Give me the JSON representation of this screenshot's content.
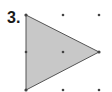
{
  "problem": {
    "number_label": "3."
  },
  "figure": {
    "shape": "triangle",
    "fill_color": "#c8c8c8",
    "stroke_color": "#555555",
    "dot_color": "#444444",
    "grid": {
      "columns": [
        26,
        63,
        99
      ],
      "rows": [
        15,
        52,
        90
      ]
    },
    "vertices": [
      [
        26,
        15
      ],
      [
        26,
        90
      ],
      [
        99,
        52
      ]
    ]
  }
}
